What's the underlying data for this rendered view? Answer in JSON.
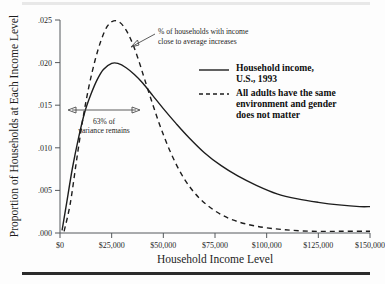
{
  "chart_data": {
    "type": "line",
    "title": "",
    "xlabel": "Household Income Level",
    "ylabel": "Proportion of Households at Each Income Level",
    "xlim": [
      0,
      150000
    ],
    "ylim": [
      0,
      0.025
    ],
    "grid": false,
    "legend_position": "upper-right-inside",
    "x_tick_labels": [
      "$0",
      "$25,000",
      "$50,000",
      "$75,000",
      "$100,000",
      "$125,000",
      "$150,000"
    ],
    "x_tick_values": [
      0,
      25000,
      50000,
      75000,
      100000,
      125000,
      150000
    ],
    "y_tick_labels": [
      ".000",
      ".005",
      ".010",
      ".015",
      ".020",
      ".025"
    ],
    "y_tick_values": [
      0,
      0.005,
      0.01,
      0.015,
      0.02,
      0.025
    ],
    "series": [
      {
        "name": "Household income, U.S., 1993",
        "style": "solid",
        "color": "#1d1d1d",
        "x": [
          1000,
          3000,
          6000,
          9000,
          12000,
          15000,
          18000,
          21000,
          25000,
          28000,
          32000,
          36000,
          40000,
          45000,
          50000,
          56000,
          62000,
          70000,
          78000,
          86000,
          95000,
          105000,
          115000,
          125000,
          135000,
          145000,
          150000
        ],
        "values": [
          0.0003,
          0.0032,
          0.0076,
          0.0112,
          0.0142,
          0.0163,
          0.018,
          0.0192,
          0.0199,
          0.0199,
          0.0194,
          0.0186,
          0.0176,
          0.0161,
          0.0146,
          0.0129,
          0.0113,
          0.0094,
          0.0079,
          0.0067,
          0.0056,
          0.0046,
          0.004,
          0.0036,
          0.0033,
          0.0031,
          0.0031
        ]
      },
      {
        "name": "All adults have the same environment and gender does not matter",
        "style": "dashed",
        "color": "#1d1d1d",
        "x": [
          2000,
          5000,
          8000,
          11000,
          14000,
          17000,
          20000,
          23000,
          26000,
          29000,
          32000,
          35000,
          38000,
          41000,
          45000,
          49000,
          54000,
          60000,
          67000,
          75000,
          84000,
          95000,
          108000,
          122000,
          136000,
          150000
        ],
        "values": [
          0.0002,
          0.0035,
          0.0085,
          0.0133,
          0.0172,
          0.0203,
          0.0227,
          0.0243,
          0.0249,
          0.0247,
          0.0238,
          0.0223,
          0.0203,
          0.018,
          0.015,
          0.0122,
          0.0092,
          0.0064,
          0.0042,
          0.0026,
          0.0015,
          0.0008,
          0.0004,
          0.0002,
          0.0002,
          0.0002
        ]
      }
    ],
    "annotations": [
      {
        "id": "peak-annotation",
        "text_line1": "% of households with income",
        "text_line2": "close to average increases",
        "arrow": "points-left-to-dashed-peak"
      },
      {
        "id": "variance-annotation",
        "text_line1": "63% of",
        "text_line2": "variance remains",
        "arrow": "double-headed-horizontal",
        "arrow_y_value": 0.015,
        "arrow_x_from": 14000,
        "arrow_x_to": 43000
      }
    ]
  },
  "legend": {
    "entries": [
      {
        "label_line1": "Household income,",
        "label_line2": "U.S., 1993",
        "style": "solid"
      },
      {
        "label_line1": "All adults have the same",
        "label_line2": "environment and gender",
        "label_line3": "does not matter",
        "style": "dashed"
      }
    ]
  }
}
